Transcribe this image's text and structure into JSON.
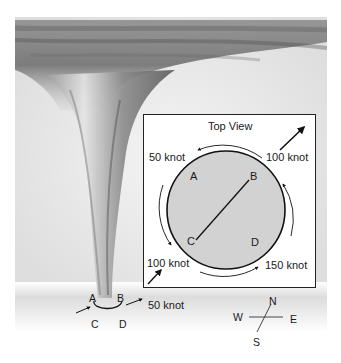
{
  "diagram": {
    "type": "tornado wind speed illustration",
    "top_view": {
      "title": "Top View",
      "points": [
        "A",
        "B",
        "C",
        "D"
      ],
      "wind_labels": {
        "upper_left": "50 knot",
        "upper_right": "100 knot",
        "lower_left": "100 knot",
        "lower_right": "150 knot"
      }
    },
    "ground": {
      "points": [
        "A",
        "B",
        "C",
        "D"
      ],
      "motion_label": "50 knot"
    },
    "compass": {
      "north": "N",
      "south": "S",
      "east": "E",
      "west": "W"
    }
  },
  "colors": {
    "funnel": "#6b6b6b",
    "disk_fill": "#d2d2d2",
    "ink": "#111111",
    "ground": "#e6e6e6"
  }
}
